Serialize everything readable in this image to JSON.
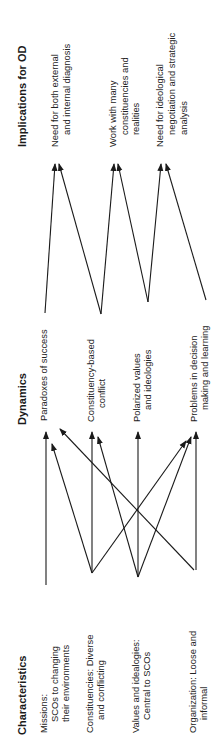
{
  "colors": {
    "ink": "#1a1a1a",
    "background": "#ffffff"
  },
  "orientation": "rotated -90deg (text reads bottom-to-top)",
  "columns": {
    "characteristics": {
      "header": "Characteristics",
      "items": [
        {
          "id": "missions",
          "lines": [
            "Missions:",
            "SCOs to changing",
            "their environments"
          ]
        },
        {
          "id": "constituencies",
          "lines": [
            "Constituencies: Diverse",
            "and conflicting"
          ]
        },
        {
          "id": "values",
          "lines": [
            "Values and idealogies:",
            "Central to SCOs"
          ]
        },
        {
          "id": "organization",
          "lines": [
            "Organization: Loose and",
            "informal"
          ]
        }
      ]
    },
    "dynamics": {
      "header": "Dynamics",
      "items": [
        {
          "id": "paradoxes",
          "lines": [
            "Paradoxes of success"
          ]
        },
        {
          "id": "conflict",
          "lines": [
            "Constituency-based",
            "conflict"
          ]
        },
        {
          "id": "polarized",
          "lines": [
            "Polarized values",
            "and ideologies"
          ]
        },
        {
          "id": "problems",
          "lines": [
            "Problems in decision",
            "making and learning"
          ]
        }
      ]
    },
    "implications": {
      "header": "Implications for OD",
      "items": [
        {
          "id": "diagnosis",
          "lines": [
            "Need for both external",
            "and internal diagnosis"
          ]
        },
        {
          "id": "constituencies_work",
          "lines": [
            "Work with many",
            "constituencies and",
            "realities"
          ]
        },
        {
          "id": "negotiation",
          "lines": [
            "Need for ideological",
            "negotiation and strategic",
            "analysis"
          ]
        }
      ]
    }
  },
  "edges": [
    {
      "from": "missions",
      "to": "paradoxes",
      "x1": 46,
      "y1": 585,
      "x2": 46,
      "y2": 432
    },
    {
      "from": "constituencies",
      "to": "paradoxes",
      "x1": 92,
      "y1": 573,
      "x2": 52,
      "y2": 444
    },
    {
      "from": "organization",
      "to": "paradoxes",
      "x1": 194,
      "y1": 570,
      "x2": 60,
      "y2": 429
    },
    {
      "from": "constituencies",
      "to": "conflict",
      "x1": 92,
      "y1": 573,
      "x2": 92,
      "y2": 432
    },
    {
      "from": "values",
      "to": "conflict",
      "x1": 138,
      "y1": 577,
      "x2": 98,
      "y2": 437
    },
    {
      "from": "values",
      "to": "polarized",
      "x1": 138,
      "y1": 577,
      "x2": 138,
      "y2": 432
    },
    {
      "from": "organization",
      "to": "problems",
      "x1": 196,
      "y1": 570,
      "x2": 196,
      "y2": 432
    },
    {
      "from": "values",
      "to": "problems",
      "x1": 138,
      "y1": 577,
      "x2": 191,
      "y2": 437
    },
    {
      "from": "constituencies",
      "to": "problems",
      "x1": 92,
      "y1": 573,
      "x2": 186,
      "y2": 441
    },
    {
      "from": "paradoxes",
      "to": "diagnosis",
      "x1": 45,
      "y1": 313,
      "x2": 55,
      "y2": 164
    },
    {
      "from": "conflict",
      "to": "diagnosis",
      "x1": 101,
      "y1": 314,
      "x2": 59,
      "y2": 164
    },
    {
      "from": "conflict",
      "to": "constituencies_work",
      "x1": 101,
      "y1": 314,
      "x2": 114,
      "y2": 164
    },
    {
      "from": "polarized",
      "to": "constituencies_work",
      "x1": 148,
      "y1": 302,
      "x2": 118,
      "y2": 164
    },
    {
      "from": "polarized",
      "to": "negotiation",
      "x1": 148,
      "y1": 302,
      "x2": 161,
      "y2": 164
    },
    {
      "from": "problems",
      "to": "negotiation",
      "x1": 206,
      "y1": 300,
      "x2": 166,
      "y2": 164
    }
  ]
}
